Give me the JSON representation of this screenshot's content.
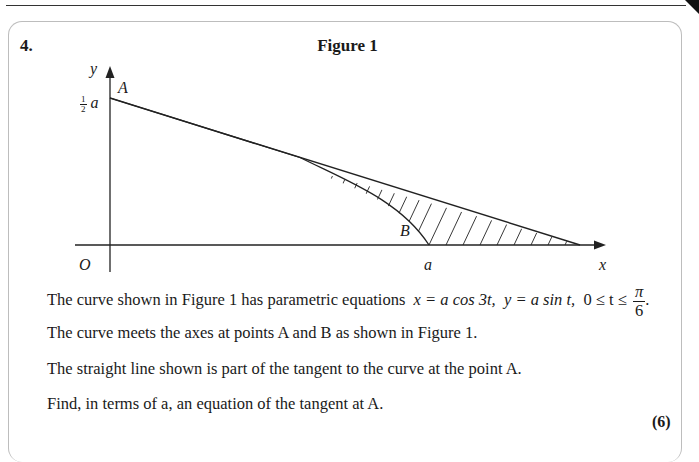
{
  "question": {
    "number": "4.",
    "figure_title": "Figure 1",
    "marks": "(6)"
  },
  "figure": {
    "axis_labels": {
      "x": "x",
      "y": "y",
      "origin": "O"
    },
    "y_tick_label_coeff": {
      "num": "1",
      "den": "2",
      "var": "a"
    },
    "x_tick_label": "a",
    "point_labels": {
      "A": "A",
      "B": "B"
    }
  },
  "text": {
    "line1_prefix": "The curve shown in Figure 1 has parametric equations",
    "eq_x": "x = a cos 3t,",
    "eq_y": "y = a sin t,",
    "range_prefix": "0 ≤ t ≤",
    "range_num": "π",
    "range_den": "6",
    "range_suffix": ".",
    "line2": "The curve meets the axes at points A and B as shown in Figure 1.",
    "line3": "The straight line shown is part of the tangent to the curve at the point A.",
    "line4": "Find, in terms of a, an equation of the tangent at A."
  }
}
